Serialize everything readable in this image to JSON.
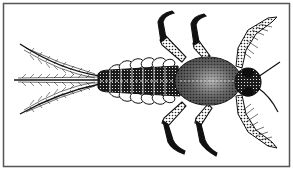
{
  "figure": {
    "style": "black-and-white stipple line drawing",
    "colors": {
      "ink": "#111111",
      "paper": "#ffffff",
      "border": "#555555"
    },
    "parts": [
      "cerci",
      "abdomen",
      "gills",
      "thorax",
      "head",
      "eyes",
      "antennae",
      "forelegs",
      "midlegs",
      "hindlegs"
    ]
  }
}
